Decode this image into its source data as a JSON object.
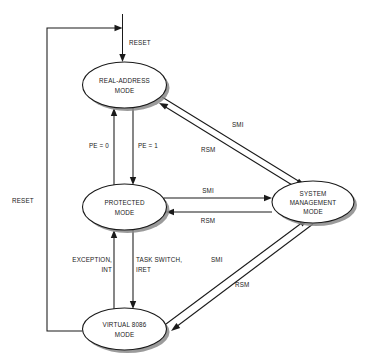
{
  "diagram": {
    "background_color": "#ffffff",
    "line_color": "#1a1a1a",
    "shadow_color": "#8a8a8a",
    "nodes": [
      {
        "id": "real-address-mode",
        "lines": [
          "REAL-ADDRESS",
          "MODE"
        ],
        "line1": "REAL-ADDRESS",
        "line2": "MODE",
        "cx": 124.5,
        "cy": 85,
        "rx": 42,
        "ry": 23
      },
      {
        "id": "protected-mode",
        "lines": [
          "PROTECTED",
          "MODE"
        ],
        "line1": "PROTECTED",
        "line2": "MODE",
        "cx": 124.5,
        "cy": 207,
        "rx": 42,
        "ry": 23
      },
      {
        "id": "virtual-8086-mode",
        "lines": [
          "VIRTUAL 8086",
          "MODE"
        ],
        "line1": "VIRTUAL 8086",
        "line2": "MODE",
        "cx": 124.5,
        "cy": 329,
        "rx": 42,
        "ry": 21
      },
      {
        "id": "system-management-mode",
        "lines": [
          "SYSTEM",
          "MANAGEMENT",
          "MODE"
        ],
        "line1": "SYSTEM",
        "line2": "MANAGEMENT",
        "line3": "MODE",
        "cx": 313,
        "cy": 202,
        "rx": 41,
        "ry": 21
      }
    ],
    "edge_labels": {
      "reset_top": "RESET",
      "reset_left": "RESET",
      "pe_zero": "PE = 0",
      "pe_one": "PE = 1",
      "smi_real_to_smm": "SMI",
      "rsm_smm_to_real": "RSM",
      "smi_protected_to_smm": "SMI",
      "rsm_smm_to_protected": "RSM",
      "exception_int_line1": "EXCEPTION,",
      "exception_int_line2": "INT",
      "task_switch_line1": "TASK SWITCH,",
      "task_switch_line2": "IRET",
      "smi_v86_to_smm": "SMI",
      "rsm_smm_to_v86": "RSM"
    }
  }
}
